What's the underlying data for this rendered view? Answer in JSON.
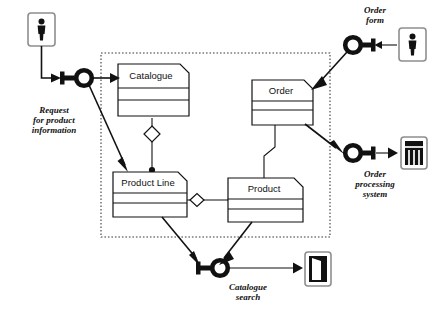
{
  "diagram": {
    "type": "uml-component-diagram",
    "colors": {
      "ink": "#111111",
      "package_border": "#3a3a3a",
      "icon_frame": "#8e8e8e",
      "background": "#ffffff"
    }
  },
  "package": {
    "name": "system-package-boundary",
    "style": "dotted"
  },
  "classes": [
    {
      "id": "catalogue",
      "label": "Catalogue",
      "compartments": 3
    },
    {
      "id": "order",
      "label": "Order",
      "compartments": 3
    },
    {
      "id": "product_line",
      "label": "Product Line",
      "compartments": 3
    },
    {
      "id": "product",
      "label": "Product",
      "compartments": 3
    }
  ],
  "interfaces": [
    {
      "id": "request_for_product_information",
      "label_lines": [
        "Request",
        "for product",
        "information"
      ],
      "icon": "lollipop-interface-icon"
    },
    {
      "id": "order_form",
      "label_lines": [
        "Order",
        "form"
      ],
      "icon": "lollipop-interface-icon"
    },
    {
      "id": "order_processing_system",
      "label_lines": [
        "Order",
        "processing",
        "system"
      ],
      "icon": "lollipop-interface-icon"
    },
    {
      "id": "catalogue_search",
      "label_lines": [
        "Catalogue",
        "search"
      ],
      "icon": "lollipop-interface-icon"
    }
  ],
  "actors": [
    {
      "id": "actor_top_left",
      "icon": "person-actor-icon"
    },
    {
      "id": "actor_top_right",
      "icon": "person-actor-icon"
    },
    {
      "id": "system_right",
      "icon": "server-rack-icon"
    },
    {
      "id": "door_bottom",
      "icon": "open-door-icon"
    }
  ],
  "labels": {
    "request_line1": "Request",
    "request_line2": "for product",
    "request_line3": "information",
    "order_form_line1": "Order",
    "order_form_line2": "form",
    "order_processing_line1": "Order",
    "order_processing_line2": "processing",
    "order_processing_line3": "system",
    "catalogue_search_line1": "Catalogue",
    "catalogue_search_line2": "search",
    "catalogue": "Catalogue",
    "order": "Order",
    "product_line": "Product Line",
    "product": "Product"
  },
  "relations": [
    {
      "from": "catalogue",
      "to": "product_line",
      "kind": "aggregation-hollow-diamond"
    },
    {
      "from": "product_line",
      "to": "product",
      "kind": "aggregation-hollow-diamond"
    },
    {
      "from": "order",
      "to": "product",
      "kind": "association"
    }
  ]
}
